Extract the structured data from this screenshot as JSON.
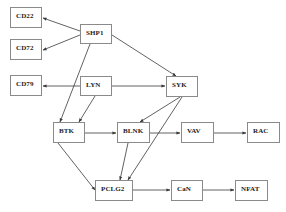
{
  "diagram": {
    "type": "signaling-pathway",
    "nodes": [
      {
        "id": "CD22",
        "label": "CD22",
        "x": 10,
        "y": 7,
        "w": 32,
        "h": 21
      },
      {
        "id": "CD72",
        "label": "CD72",
        "x": 10,
        "y": 39,
        "w": 32,
        "h": 21
      },
      {
        "id": "SHP1",
        "label": "SHP1",
        "x": 80,
        "y": 24,
        "w": 32,
        "h": 20
      },
      {
        "id": "CD79",
        "label": "CD79",
        "x": 10,
        "y": 75,
        "w": 32,
        "h": 21
      },
      {
        "id": "LYN",
        "label": "LYN",
        "x": 80,
        "y": 76,
        "w": 32,
        "h": 20
      },
      {
        "id": "SYK",
        "label": "SYK",
        "x": 166,
        "y": 76,
        "w": 32,
        "h": 21
      },
      {
        "id": "BTK",
        "label": "BTK",
        "x": 53,
        "y": 122,
        "w": 32,
        "h": 21
      },
      {
        "id": "BLNK",
        "label": "BLNK",
        "x": 117,
        "y": 122,
        "w": 33,
        "h": 21
      },
      {
        "id": "VAV",
        "label": "VAV",
        "x": 181,
        "y": 122,
        "w": 33,
        "h": 21
      },
      {
        "id": "RAC",
        "label": "RAC",
        "x": 247,
        "y": 122,
        "w": 33,
        "h": 21
      },
      {
        "id": "PCLG2",
        "label": "PCLG2",
        "x": 95,
        "y": 180,
        "w": 38,
        "h": 21
      },
      {
        "id": "CaN",
        "label": "CaN",
        "x": 171,
        "y": 180,
        "w": 32,
        "h": 21
      },
      {
        "id": "NFAT",
        "label": "NFAT",
        "x": 235,
        "y": 180,
        "w": 33,
        "h": 21
      }
    ],
    "edges": [
      {
        "from": "SHP1",
        "to": "CD22",
        "points": [
          80,
          31,
          43,
          18
        ]
      },
      {
        "from": "SHP1",
        "to": "CD72",
        "points": [
          80,
          35,
          43,
          50
        ]
      },
      {
        "from": "SHP1",
        "to": "SYK",
        "points": [
          112,
          35,
          176,
          76
        ]
      },
      {
        "from": "SHP1",
        "to": "BTK",
        "points": [
          90,
          44,
          60,
          122
        ]
      },
      {
        "from": "LYN",
        "to": "CD79",
        "points": [
          80,
          86,
          43,
          86
        ]
      },
      {
        "from": "LYN",
        "to": "SYK",
        "points": [
          112,
          86,
          165,
          86
        ]
      },
      {
        "from": "LYN",
        "to": "BTK",
        "points": [
          95,
          96,
          79,
          122
        ]
      },
      {
        "from": "SYK",
        "to": "BLNK",
        "points": [
          180,
          97,
          140,
          122
        ]
      },
      {
        "from": "SYK",
        "to": "PCLG2",
        "points": [
          182,
          97,
          128,
          180
        ]
      },
      {
        "from": "BTK",
        "to": "BLNK",
        "points": [
          85,
          133,
          116,
          133
        ]
      },
      {
        "from": "BTK",
        "to": "PCLG2",
        "points": [
          58,
          143,
          95,
          190
        ]
      },
      {
        "from": "BLNK",
        "to": "VAV",
        "points": [
          150,
          133,
          180,
          133
        ]
      },
      {
        "from": "BLNK",
        "to": "PCLG2",
        "points": [
          128,
          143,
          120,
          180
        ]
      },
      {
        "from": "VAV",
        "to": "RAC",
        "points": [
          214,
          133,
          246,
          133
        ]
      },
      {
        "from": "PCLG2",
        "to": "CaN",
        "points": [
          133,
          190,
          170,
          190
        ]
      },
      {
        "from": "CaN",
        "to": "NFAT",
        "points": [
          203,
          190,
          234,
          190
        ]
      }
    ],
    "colors": {
      "edge": "#3a3a3a",
      "node_border": "#8a8a8a",
      "node_text": "#222222",
      "background": "#ffffff"
    }
  }
}
